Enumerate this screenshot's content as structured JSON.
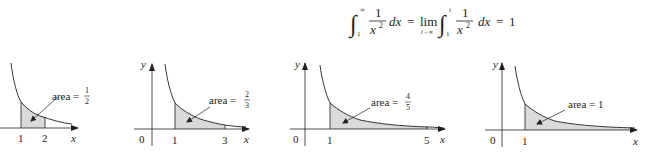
{
  "equation": {
    "lhs_lower": "1",
    "lhs_upper": "∞",
    "lhs_num": "1",
    "lhs_den": "x",
    "lhs_den_exp": "2",
    "lhs_dx": "dx",
    "eq1": "=",
    "lim": "lim",
    "lim_sub": "t→∞",
    "rhs_lower": "1",
    "rhs_upper": "t",
    "rhs_num": "1",
    "rhs_den": "x",
    "rhs_den_exp": "2",
    "rhs_dx": "dx",
    "eq2": "=",
    "result": "1"
  },
  "colors": {
    "ink": "#231f20",
    "shade": "#d9dadb"
  },
  "panels": [
    {
      "y_label": "y",
      "x_label": "x",
      "origin_label": "",
      "tick_labels": [
        "1",
        "2"
      ],
      "area_text": "area =",
      "area_num": "1",
      "area_den": "2",
      "upper_limit": 2
    },
    {
      "y_label": "y",
      "x_label": "x",
      "origin_label": "0",
      "tick_labels": [
        "1",
        "3"
      ],
      "area_text": "area =",
      "area_num": "2",
      "area_den": "3",
      "upper_limit": 3
    },
    {
      "y_label": "y",
      "x_label": "x",
      "origin_label": "0",
      "tick_labels": [
        "1",
        "5"
      ],
      "area_text": "area =",
      "area_num": "4",
      "area_den": "5",
      "upper_limit": 5
    },
    {
      "y_label": "y",
      "x_label": "x",
      "origin_label": "0",
      "tick_labels": [
        "1"
      ],
      "area_text": "area = 1",
      "upper_limit": "∞"
    }
  ]
}
